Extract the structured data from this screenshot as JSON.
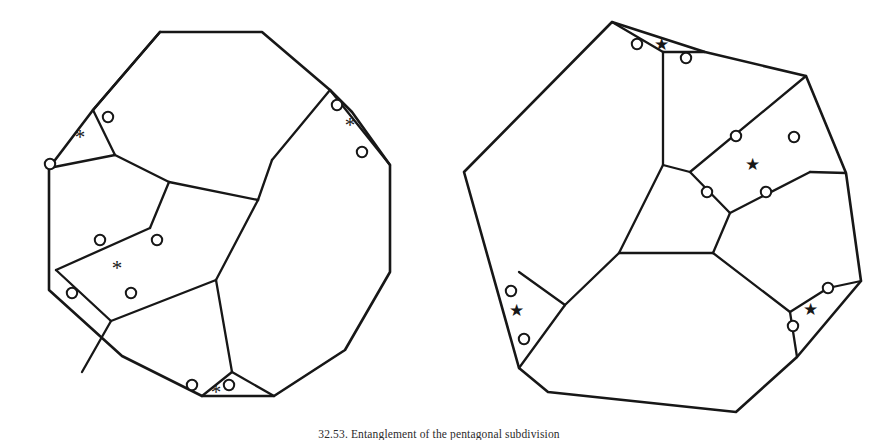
{
  "figure": {
    "background_color": "#ffffff",
    "stroke_color": "#171717",
    "node_fill_color": "#ffffff",
    "width": 878,
    "height": 444,
    "caption": {
      "text": "32.53.  Entanglement of the pentagonal subdivision",
      "visible": "partially cropped at bottom edge",
      "left": 0,
      "top": 428,
      "font_size": 11.5
    },
    "panels": [
      {
        "id": "left-panel",
        "name": "decagon-subdivision",
        "marker_glyph": "*",
        "marker_type": "asterisk",
        "outer_polygon": {
          "name": "outer-decagon",
          "sides": 12,
          "points": "160,32 262,32 330,90 352,112 390,165 390,272 345,350 274,396 202,396 122,356 49,290 49,168 93,110"
        },
        "inner_edges": [
          {
            "name": "edge-upper-left-spur",
            "points": "93,110 160,32"
          },
          {
            "name": "edge-left-star-base",
            "points": "49,168 115,155"
          },
          {
            "name": "edge-left-star-side",
            "points": "115,155 93,110"
          },
          {
            "name": "edge-mid-diagonal-a",
            "points": "115,155 169,182"
          },
          {
            "name": "edge-mid-diagonal-b",
            "points": "169,182 258,200"
          },
          {
            "name": "edge-mid-diagonal-c",
            "points": "258,200 272,160"
          },
          {
            "name": "edge-right-star-base",
            "points": "272,160 330,90"
          },
          {
            "name": "edge-right-star-side",
            "points": "330,90 390,165"
          },
          {
            "name": "edge-long-diagonal",
            "points": "258,200 216,280"
          },
          {
            "name": "edge-quad-top",
            "points": "169,182 150,228"
          },
          {
            "name": "edge-quad-left",
            "points": "150,228 56,270"
          },
          {
            "name": "edge-quad-bottom",
            "points": "56,270 111,321"
          },
          {
            "name": "edge-quad-right",
            "points": "111,321 216,280"
          },
          {
            "name": "edge-lower-spur-a",
            "points": "111,321 82,372"
          },
          {
            "name": "edge-lower-spur-b",
            "points": "216,280 232,372"
          },
          {
            "name": "edge-bottom-star-left",
            "points": "232,372 202,396"
          },
          {
            "name": "edge-bottom-star-right",
            "points": "232,372 274,396"
          }
        ],
        "nodes": [
          {
            "name": "node-left-upper",
            "cx": 108,
            "cy": 117,
            "r": 5.2
          },
          {
            "name": "node-left-lower",
            "cx": 50,
            "cy": 164,
            "r": 5.2
          },
          {
            "name": "node-right-upper",
            "cx": 337,
            "cy": 105,
            "r": 5.2
          },
          {
            "name": "node-right-lower",
            "cx": 362,
            "cy": 152,
            "r": 5.2
          },
          {
            "name": "node-quad-top-left",
            "cx": 100,
            "cy": 240,
            "r": 5.2
          },
          {
            "name": "node-quad-top-right",
            "cx": 157,
            "cy": 240,
            "r": 5.2
          },
          {
            "name": "node-quad-bottom-left",
            "cx": 72,
            "cy": 293,
            "r": 5.2
          },
          {
            "name": "node-quad-bottom-right",
            "cx": 131,
            "cy": 293,
            "r": 5.2
          },
          {
            "name": "node-bottom-left",
            "cx": 192,
            "cy": 385,
            "r": 5.2
          },
          {
            "name": "node-bottom-right",
            "cx": 229,
            "cy": 385,
            "r": 5.2
          }
        ],
        "markers": [
          {
            "name": "marker-left-star",
            "x": 80,
            "y": 137,
            "glyph": "*"
          },
          {
            "name": "marker-right-star",
            "x": 350,
            "y": 125,
            "glyph": "*"
          },
          {
            "name": "marker-center-star",
            "x": 117,
            "y": 268,
            "glyph": "*"
          },
          {
            "name": "marker-bottom-star",
            "x": 216,
            "y": 392,
            "glyph": "*"
          }
        ]
      },
      {
        "id": "right-panel",
        "name": "heptagon-subdivision",
        "marker_glyph": "★",
        "marker_type": "five-pointed-star",
        "outer_polygon": {
          "name": "outer-heptagon",
          "sides": 10,
          "points": "612,22 705,52 806,76 846,173 861,281 797,357 736,412 548,392 519,368 464,172"
        },
        "inner_edges": [
          {
            "name": "edge-top-star-left",
            "points": "612,22 663,52"
          },
          {
            "name": "edge-top-star-right",
            "points": "663,52 705,52"
          },
          {
            "name": "edge-top-stem",
            "points": "663,52 663,165"
          },
          {
            "name": "edge-center-left-a",
            "points": "663,165 690,172"
          },
          {
            "name": "edge-center-upper-right",
            "points": "690,172 806,76"
          },
          {
            "name": "edge-center-node-chain",
            "points": "690,172 730,213"
          },
          {
            "name": "edge-center-right-chain",
            "points": "730,213 810,172"
          },
          {
            "name": "edge-center-right-out",
            "points": "810,172 846,173"
          },
          {
            "name": "edge-center-lower-left",
            "points": "663,165 619,253"
          },
          {
            "name": "edge-hub-horizontal",
            "points": "619,253 713,253"
          },
          {
            "name": "edge-hub-to-chain",
            "points": "713,253 730,213"
          },
          {
            "name": "edge-hub-lower-right",
            "points": "713,253 790,312"
          },
          {
            "name": "edge-right-star-base",
            "points": "790,312 828,288"
          },
          {
            "name": "edge-right-star-side",
            "points": "828,288 861,281"
          },
          {
            "name": "edge-right-star-lower",
            "points": "790,312 797,357"
          },
          {
            "name": "edge-hub-lower-left",
            "points": "619,253 565,305"
          },
          {
            "name": "edge-left-star-base",
            "points": "565,305 519,368"
          },
          {
            "name": "edge-left-star-side",
            "points": "565,305 519,368"
          },
          {
            "name": "edge-left-star-upper",
            "points": "565,305 519,272"
          }
        ],
        "nodes": [
          {
            "name": "node-top-left",
            "cx": 637,
            "cy": 44,
            "r": 5.2
          },
          {
            "name": "node-top-right",
            "cx": 686,
            "cy": 58,
            "r": 5.2
          },
          {
            "name": "node-center-upper-left",
            "cx": 736,
            "cy": 136,
            "r": 5.2
          },
          {
            "name": "node-center-upper-right",
            "cx": 794,
            "cy": 137,
            "r": 5.2
          },
          {
            "name": "node-center-lower-left",
            "cx": 707,
            "cy": 192,
            "r": 5.2
          },
          {
            "name": "node-center-lower-right",
            "cx": 766,
            "cy": 192,
            "r": 5.2
          },
          {
            "name": "node-left-star-upper",
            "cx": 511,
            "cy": 291,
            "r": 5.2
          },
          {
            "name": "node-left-star-lower",
            "cx": 524,
            "cy": 339,
            "r": 5.2
          },
          {
            "name": "node-right-star-upper",
            "cx": 828,
            "cy": 288,
            "r": 5.2
          },
          {
            "name": "node-right-star-lower",
            "cx": 793,
            "cy": 326,
            "r": 5.2
          }
        ],
        "markers": [
          {
            "name": "marker-top-star",
            "x": 661,
            "y": 44,
            "glyph": "★"
          },
          {
            "name": "marker-center-star",
            "x": 752,
            "y": 164,
            "glyph": "★"
          },
          {
            "name": "marker-left-star",
            "x": 516,
            "y": 310,
            "glyph": "★"
          },
          {
            "name": "marker-right-star",
            "x": 810,
            "y": 309,
            "glyph": "★"
          }
        ]
      }
    ]
  }
}
